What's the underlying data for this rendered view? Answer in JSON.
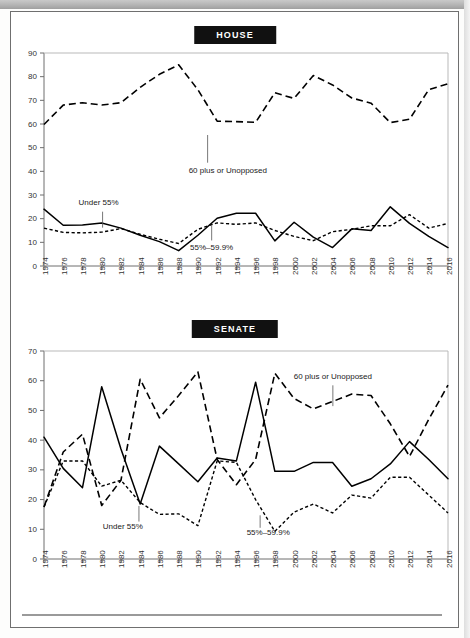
{
  "page": {
    "background_color": "#ffffff",
    "frame_color": "#6f6f6f"
  },
  "charts": [
    {
      "id": "house",
      "title": "HOUSE",
      "title_bg": "#111111",
      "title_fg": "#ffffff"
    },
    {
      "id": "senate",
      "title": "SENATE",
      "title_bg": "#111111",
      "title_fg": "#ffffff"
    }
  ],
  "annotations": {
    "sixty_plus": "60 plus or Unopposed",
    "under_55": "Under 55%",
    "range_55_599": "55%–59.9%"
  },
  "chart_data": [
    {
      "type": "line",
      "title": "HOUSE",
      "xlabel": "",
      "ylabel": "",
      "ylim": [
        0,
        90
      ],
      "ytick_step": 10,
      "grid": false,
      "legend": "inline-annotations",
      "categories": [
        1974,
        1976,
        1978,
        1980,
        1982,
        1984,
        1986,
        1988,
        1990,
        1992,
        1994,
        1996,
        1998,
        2000,
        2002,
        2004,
        2006,
        2008,
        2010,
        2012,
        2014,
        2016
      ],
      "x": [
        "1974",
        "1976",
        "1978",
        "1980",
        "1982",
        "1984",
        "1986",
        "1988",
        "1990",
        "1992",
        "1994",
        "1996",
        "1998",
        "2000",
        "2002",
        "2004",
        "2006",
        "2008",
        "2010",
        "2012",
        "2014",
        "2016"
      ],
      "yticks": [
        "0",
        "10",
        "20",
        "30",
        "40",
        "50",
        "60",
        "70",
        "80",
        "90"
      ],
      "series": [
        {
          "name": "60 plus or Unopposed",
          "style": "dashed-long",
          "values": [
            59.8,
            68.0,
            69.0,
            68.0,
            69.0,
            75.5,
            81.0,
            85.0,
            74.5,
            61.2,
            61.0,
            60.7,
            73.2,
            70.8,
            80.5,
            76.5,
            71.0,
            68.8,
            60.6,
            62.0,
            74.5,
            77.0
          ]
        },
        {
          "name": "Under 55%",
          "style": "solid",
          "values": [
            24.0,
            17.2,
            17.3,
            18.2,
            16.0,
            13.0,
            10.3,
            6.5,
            13.0,
            20.2,
            22.3,
            22.3,
            10.6,
            18.5,
            12.2,
            7.8,
            15.7,
            15.0,
            25.0,
            18.0,
            12.5,
            7.8
          ]
        },
        {
          "name": "55%–59.9%",
          "style": "dashed-short",
          "values": [
            16.0,
            14.2,
            14.0,
            14.3,
            15.8,
            13.4,
            11.3,
            9.5,
            15.5,
            18.2,
            17.6,
            18.2,
            15.0,
            12.5,
            10.7,
            14.5,
            15.5,
            17.0,
            17.0,
            21.7,
            16.0,
            18.0
          ]
        }
      ]
    },
    {
      "type": "line",
      "title": "SENATE",
      "xlabel": "",
      "ylabel": "",
      "ylim": [
        0,
        70
      ],
      "ytick_step": 10,
      "grid": false,
      "legend": "inline-annotations",
      "categories": [
        1974,
        1976,
        1978,
        1980,
        1982,
        1984,
        1986,
        1988,
        1990,
        1992,
        1994,
        1996,
        1998,
        2000,
        2002,
        2004,
        2006,
        2008,
        2010,
        2012,
        2014,
        2016
      ],
      "x": [
        "1974",
        "1976",
        "1978",
        "1980",
        "1982",
        "1984",
        "1986",
        "1988",
        "1990",
        "1992",
        "1994",
        "1996",
        "1998",
        "2000",
        "2002",
        "2004",
        "2006",
        "2008",
        "2010",
        "2012",
        "2014",
        "2016"
      ],
      "yticks": [
        "0",
        "10",
        "20",
        "30",
        "40",
        "50",
        "60",
        "70"
      ],
      "series": [
        {
          "name": "60 plus or Unopposed",
          "style": "dashed-long",
          "values": [
            17.5,
            36.0,
            42.0,
            18.0,
            26.5,
            60.5,
            47.5,
            55.0,
            63.0,
            33.5,
            25.0,
            33.5,
            62.5,
            54.0,
            50.5,
            53.0,
            55.5,
            55.0,
            45.5,
            34.5,
            47.0,
            58.5
          ]
        },
        {
          "name": "Under 55%",
          "style": "solid",
          "values": [
            41.0,
            30.5,
            24.0,
            58.0,
            37.0,
            18.5,
            38.0,
            32.0,
            26.0,
            34.0,
            33.0,
            59.5,
            29.5,
            29.5,
            32.5,
            32.5,
            24.5,
            27.0,
            32.0,
            39.5,
            33.5,
            27.0
          ]
        },
        {
          "name": "55%–59.9%",
          "style": "dashed-short",
          "values": [
            17.5,
            33.0,
            33.0,
            24.5,
            26.5,
            19.0,
            15.0,
            15.2,
            11.2,
            33.0,
            32.5,
            20.0,
            9.3,
            15.8,
            18.5,
            15.5,
            21.5,
            20.5,
            27.5,
            27.5,
            21.5,
            15.5
          ]
        }
      ]
    }
  ]
}
